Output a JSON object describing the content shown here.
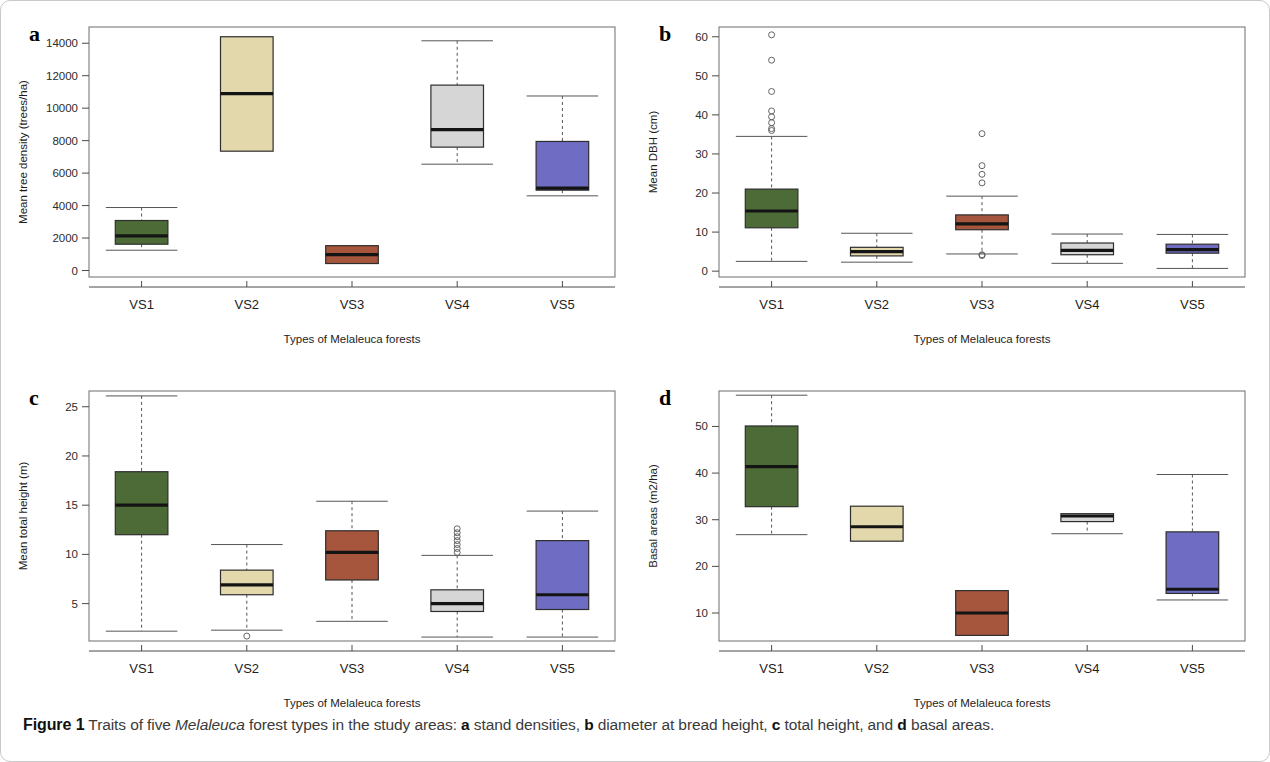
{
  "figure": {
    "caption_label": "Figure 1",
    "caption_text_1": " Traits of five ",
    "caption_italic": "Melaleuca",
    "caption_text_2": " forest types in the study areas: ",
    "caption_a": "a",
    "caption_a_text": " stand densities, ",
    "caption_b": "b",
    "caption_b_text": " diameter at bread height, ",
    "caption_c": "c",
    "caption_c_text": " total height, and ",
    "caption_d": "d",
    "caption_d_text": " basal areas."
  },
  "colors": {
    "green": "#4d6b37",
    "tan": "#e3d7ac",
    "red": "#a6563c",
    "grey": "#d6d6d6",
    "blue": "#6f6cc4",
    "box_stroke": "#2e2e2e",
    "median": "#141414",
    "whisker": "#555555",
    "frame": "#6d6d6d"
  },
  "chart_data": [
    {
      "id": "a",
      "panel_letter": "a",
      "type": "box",
      "title": "",
      "ylabel": "Mean tree density (trees/ha)",
      "xlabel": "Types of Melaleuca forests",
      "categories": [
        "VS1",
        "VS2",
        "VS3",
        "VS4",
        "VS5"
      ],
      "yticks": [
        0,
        2000,
        4000,
        6000,
        8000,
        10000,
        12000,
        14000
      ],
      "ylim": [
        -400,
        15000
      ],
      "grid": false,
      "legend": "none",
      "boxes": [
        {
          "category": "VS1",
          "color": "green",
          "min": 1250,
          "q1": 1620,
          "median": 2130,
          "q3": 3080,
          "max": 3880,
          "outliers": []
        },
        {
          "category": "VS2",
          "color": "tan",
          "min": 7350,
          "q1": 7350,
          "median": 10900,
          "q3": 14400,
          "max": 14400,
          "outliers": []
        },
        {
          "category": "VS3",
          "color": "red",
          "min": 430,
          "q1": 430,
          "median": 980,
          "q3": 1530,
          "max": 1530,
          "outliers": []
        },
        {
          "category": "VS4",
          "color": "grey",
          "min": 6550,
          "q1": 7600,
          "median": 8680,
          "q3": 11420,
          "max": 14150,
          "outliers": []
        },
        {
          "category": "VS5",
          "color": "blue",
          "min": 4600,
          "q1": 4950,
          "median": 5080,
          "q3": 7950,
          "max": 10750,
          "outliers": []
        }
      ]
    },
    {
      "id": "b",
      "panel_letter": "b",
      "type": "box",
      "title": "",
      "ylabel": "Mean DBH (cm)",
      "xlabel": "Types of Melaleuca forests",
      "categories": [
        "VS1",
        "VS2",
        "VS3",
        "VS4",
        "VS5"
      ],
      "yticks": [
        0,
        10,
        20,
        30,
        40,
        50,
        60
      ],
      "ylim": [
        -1.5,
        62.5
      ],
      "grid": false,
      "legend": "none",
      "boxes": [
        {
          "category": "VS1",
          "color": "green",
          "min": 2.5,
          "q1": 11.1,
          "median": 15.4,
          "q3": 21.0,
          "max": 34.5,
          "outliers": [
            36.0,
            36.5,
            38.0,
            39.5,
            41.0,
            46.0,
            54.0,
            60.5
          ]
        },
        {
          "category": "VS2",
          "color": "tan",
          "min": 2.3,
          "q1": 3.9,
          "median": 5.0,
          "q3": 6.1,
          "max": 9.7,
          "outliers": []
        },
        {
          "category": "VS3",
          "color": "red",
          "min": 4.4,
          "q1": 10.6,
          "median": 12.1,
          "q3": 14.4,
          "max": 19.2,
          "outliers": [
            4.0,
            4.2,
            22.6,
            24.8,
            27.0,
            35.2
          ]
        },
        {
          "category": "VS4",
          "color": "grey",
          "min": 2.0,
          "q1": 4.2,
          "median": 5.3,
          "q3": 7.2,
          "max": 9.5,
          "outliers": []
        },
        {
          "category": "VS5",
          "color": "blue",
          "min": 0.7,
          "q1": 4.6,
          "median": 5.5,
          "q3": 6.9,
          "max": 9.4,
          "outliers": []
        }
      ]
    },
    {
      "id": "c",
      "panel_letter": "c",
      "type": "box",
      "title": "",
      "ylabel": "Mean total height (m)",
      "xlabel": "Types of Melaleuca forests",
      "categories": [
        "VS1",
        "VS2",
        "VS3",
        "VS4",
        "VS5"
      ],
      "yticks": [
        5,
        10,
        15,
        20,
        25
      ],
      "ylim": [
        1.2,
        26.6
      ],
      "grid": false,
      "legend": "none",
      "boxes": [
        {
          "category": "VS1",
          "color": "green",
          "min": 2.2,
          "q1": 12.0,
          "median": 15.0,
          "q3": 18.4,
          "max": 26.1,
          "outliers": []
        },
        {
          "category": "VS2",
          "color": "tan",
          "min": 2.3,
          "q1": 5.9,
          "median": 6.9,
          "q3": 8.4,
          "max": 11.0,
          "outliers": [
            1.7
          ]
        },
        {
          "category": "VS3",
          "color": "red",
          "min": 3.2,
          "q1": 7.4,
          "median": 10.2,
          "q3": 12.4,
          "max": 15.4,
          "outliers": []
        },
        {
          "category": "VS4",
          "color": "grey",
          "min": 1.6,
          "q1": 4.2,
          "median": 5.0,
          "q3": 6.4,
          "max": 9.9,
          "outliers": [
            10.2,
            10.6,
            11.0,
            11.4,
            11.8,
            12.2,
            12.6
          ]
        },
        {
          "category": "VS5",
          "color": "blue",
          "min": 1.6,
          "q1": 4.4,
          "median": 5.9,
          "q3": 11.4,
          "max": 14.4,
          "outliers": []
        }
      ]
    },
    {
      "id": "d",
      "panel_letter": "d",
      "type": "box",
      "title": "",
      "ylabel": "Basal areas (m2/ha)",
      "xlabel": "Types of Melaleuca forests",
      "categories": [
        "VS1",
        "VS2",
        "VS3",
        "VS4",
        "VS5"
      ],
      "yticks": [
        10,
        20,
        30,
        40,
        50
      ],
      "ylim": [
        4.0,
        57.6
      ],
      "grid": false,
      "legend": "none",
      "boxes": [
        {
          "category": "VS1",
          "color": "green",
          "min": 26.8,
          "q1": 32.8,
          "median": 41.4,
          "q3": 50.1,
          "max": 56.7,
          "outliers": []
        },
        {
          "category": "VS2",
          "color": "tan",
          "min": 25.4,
          "q1": 25.4,
          "median": 28.5,
          "q3": 32.9,
          "max": 32.9,
          "outliers": []
        },
        {
          "category": "VS3",
          "color": "red",
          "min": 5.2,
          "q1": 5.2,
          "median": 10.0,
          "q3": 14.8,
          "max": 14.8,
          "outliers": []
        },
        {
          "category": "VS4",
          "color": "grey",
          "min": 27.0,
          "q1": 29.6,
          "median": 30.8,
          "q3": 31.3,
          "max": 31.3,
          "outliers": []
        },
        {
          "category": "VS5",
          "color": "blue",
          "min": 12.8,
          "q1": 14.2,
          "median": 15.1,
          "q3": 27.4,
          "max": 39.7,
          "outliers": []
        }
      ]
    }
  ]
}
